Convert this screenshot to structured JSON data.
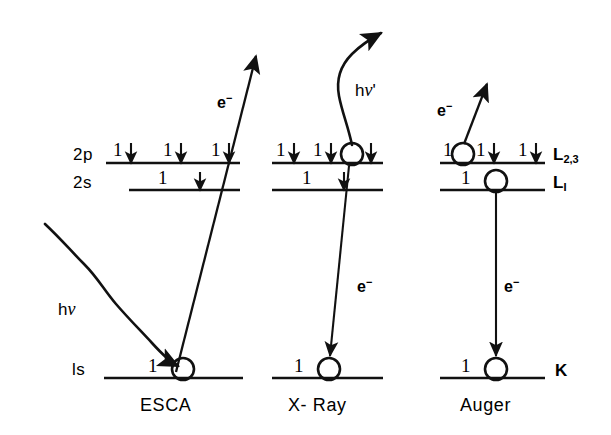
{
  "figure": {
    "ink_color": "#111111",
    "background": "#ffffff"
  },
  "shell_labels": {
    "two_p": "2p",
    "two_s": "2s",
    "one_s": "ls"
  },
  "right_labels": {
    "l23_main": "L",
    "l23_sub": "2,3",
    "l1_main": "L",
    "l1_sub": "I",
    "k": "K"
  },
  "captions": {
    "esca": "ESCA",
    "xray": "X- Ray",
    "auger": "Auger"
  },
  "particles": {
    "photoelectron": "e",
    "photoelectron_charge": "−",
    "xray_electron": "e",
    "xray_electron_charge": "−",
    "auger_electron": "e",
    "auger_electron_charge": "−",
    "incident_photon_h": "h",
    "incident_photon_nu": "ν",
    "emitted_photon_h": "h",
    "emitted_photon_nu": "ν",
    "emitted_photon_prime": "'"
  },
  "occupancies": {
    "esca_2p": [
      "1",
      "1",
      "1"
    ],
    "esca_2s": [
      "1"
    ],
    "esca_1s": [
      "1"
    ],
    "xray_2p": [
      "1",
      "1",
      ""
    ],
    "xray_2s": [
      "1"
    ],
    "xray_1s": [
      "1"
    ],
    "auger_2p": [
      "1",
      "1",
      "1"
    ],
    "auger_2s": [
      "1"
    ],
    "auger_1s": [
      "1"
    ]
  },
  "columns": [
    {
      "name": "ESCA",
      "hole_level": "1s",
      "emission": "photoelectron"
    },
    {
      "name": "X- Ray",
      "hole_level": "2p",
      "emission": "characteristic x-ray photon"
    },
    {
      "name": "Auger",
      "hole_level": "L2,3 and L1",
      "emission": "auger electron"
    }
  ]
}
